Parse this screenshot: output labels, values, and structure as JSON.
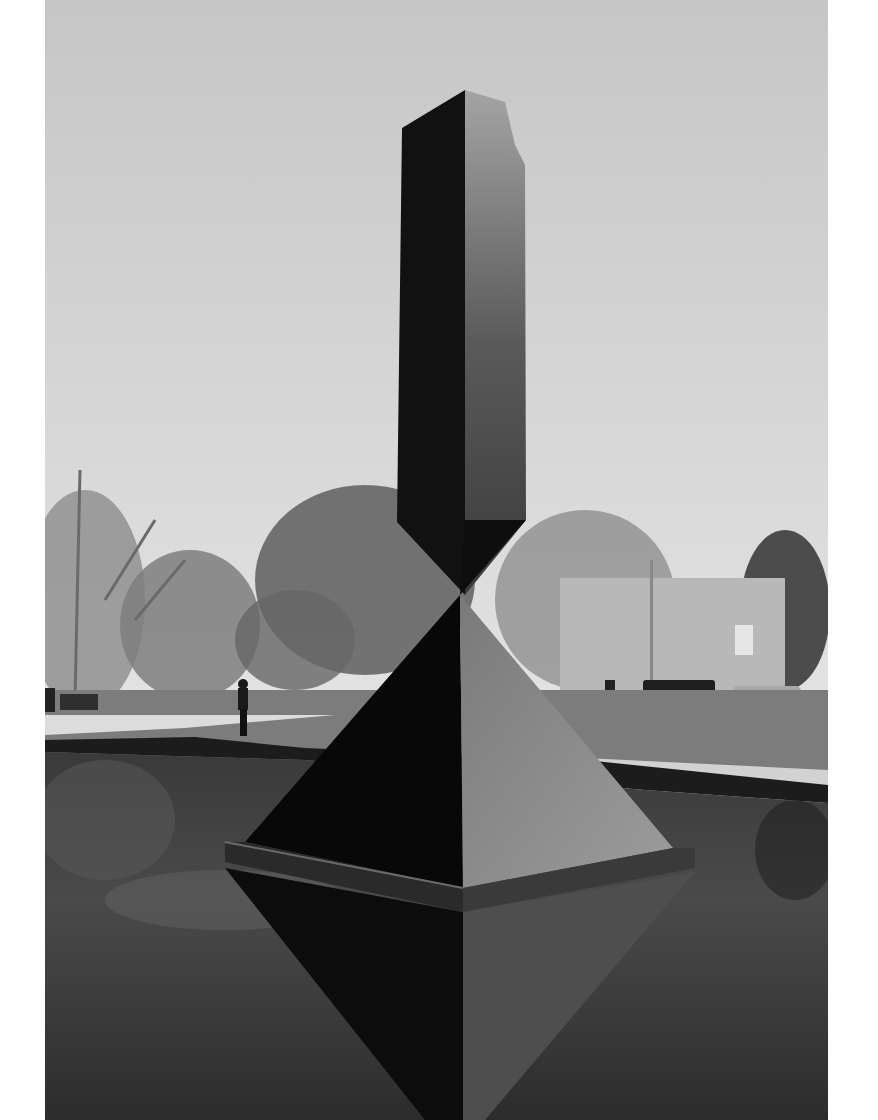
{
  "image": {
    "description": "Black-and-white photograph of a tall broken obelisk sculpture balanced point-to-point on a pyramid, standing in a reflecting pool with trees, a pedestrian, parked cars and a building in the background",
    "style": "monochrome",
    "subjects": [
      "obelisk-sculpture",
      "pyramid-base",
      "reflecting-pool",
      "trees",
      "pedestrian",
      "park-bench",
      "pickup-truck",
      "sedan",
      "building",
      "lamp-post"
    ],
    "palette": {
      "sky": "#c9c9c9",
      "obelisk_dark": "#141414",
      "obelisk_light": "#6a6a6a",
      "pyramid_light": "#8a8a8a",
      "water": "#2a2a2a",
      "grass": "#7a7a7a",
      "walkway": "#d8d8d8",
      "margin": "#ffffff"
    }
  }
}
